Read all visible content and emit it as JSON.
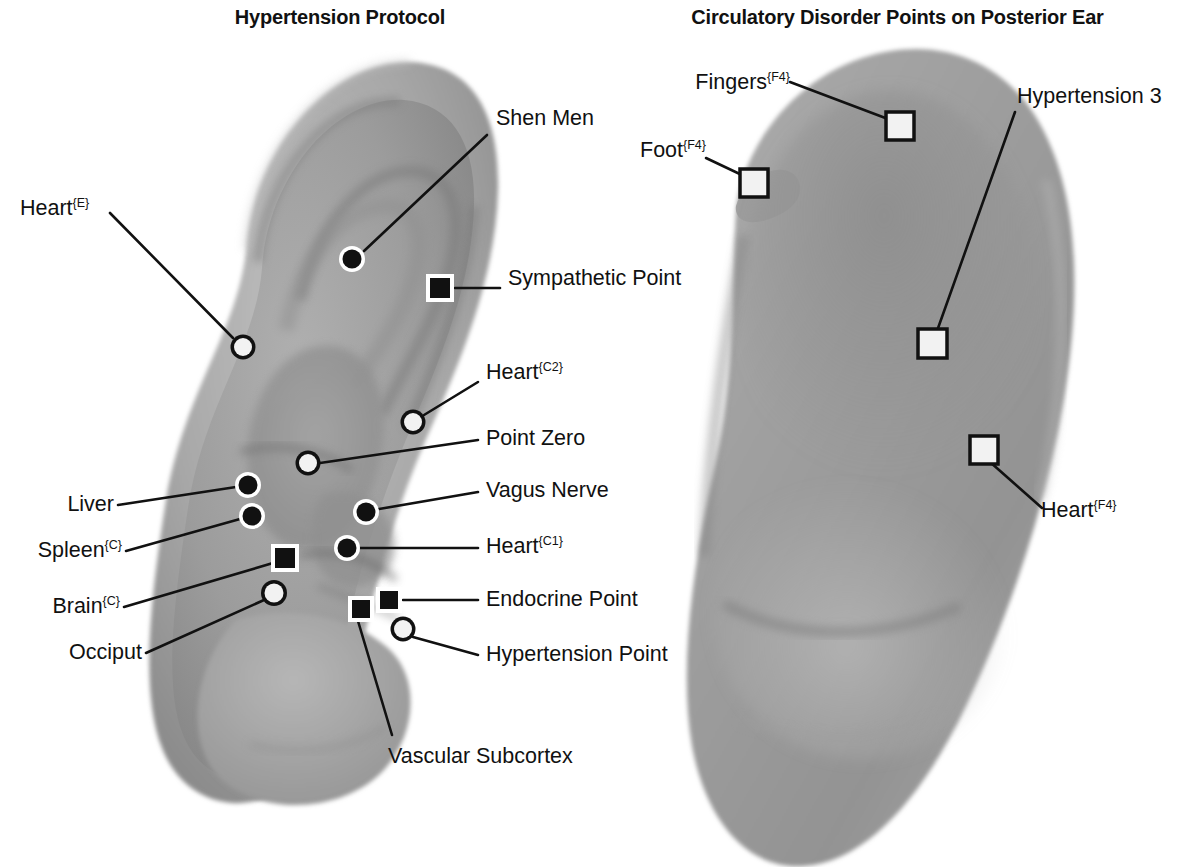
{
  "panels": {
    "left": {
      "title": "Hypertension Protocol",
      "ear_view": "anterior-ear-lateral-surface"
    },
    "right": {
      "title": "Circulatory Disorder Points on Posterior Ear",
      "ear_view": "posterior-ear-surface"
    }
  },
  "labels": {
    "shen_men": "Shen Men",
    "heart_e": "Heart",
    "heart_e_sup": "{E}",
    "sympathetic_point": "Sympathetic Point",
    "heart_c2": "Heart",
    "heart_c2_sup": "{C2}",
    "point_zero": "Point Zero",
    "vagus_nerve": "Vagus Nerve",
    "heart_c1": "Heart",
    "heart_c1_sup": "{C1}",
    "endocrine_point": "Endocrine Point",
    "hypertension_point": "Hypertension Point",
    "liver": "Liver",
    "spleen": "Spleen",
    "spleen_sup": "{C}",
    "brain": "Brain",
    "brain_sup": "{C}",
    "occiput": "Occiput",
    "vascular_subcortex": "Vascular Subcortex",
    "fingers": "Fingers",
    "fingers_sup": "{F4}",
    "foot": "Foot",
    "foot_sup": "{F4}",
    "hypertension_3": "Hypertension 3",
    "heart_f4": "Heart",
    "heart_f4_sup": "{F4}"
  },
  "colors": {
    "background": "#ffffff",
    "text": "#111111",
    "leader_line": "#111111",
    "marker_filled": "#111111",
    "marker_hollow_fill": "#f2f2f2",
    "marker_ring": "#ffffff",
    "ear_light": "#b4b4b4",
    "ear_mid": "#9a9a9a",
    "ear_dark": "#808080",
    "ear_shadow": "#6d6d6d"
  },
  "markers": {
    "left_panel": [
      {
        "id": "shen-men",
        "label": "Shen Men",
        "shape": "circle",
        "style": "filled-ring",
        "x": 352,
        "y": 259
      },
      {
        "id": "heart-e",
        "label": "Heart {E}",
        "shape": "circle",
        "style": "hollow",
        "x": 243,
        "y": 347
      },
      {
        "id": "sympathetic-point",
        "label": "Sympathetic Point",
        "shape": "square",
        "style": "filled-ring",
        "x": 440,
        "y": 288
      },
      {
        "id": "heart-c2",
        "label": "Heart {C2}",
        "shape": "circle",
        "style": "hollow",
        "x": 413,
        "y": 422
      },
      {
        "id": "point-zero",
        "label": "Point Zero",
        "shape": "circle",
        "style": "hollow",
        "x": 308,
        "y": 463
      },
      {
        "id": "liver",
        "label": "Liver",
        "shape": "circle",
        "style": "filled-ring",
        "x": 248,
        "y": 485
      },
      {
        "id": "spleen-c",
        "label": "Spleen {C}",
        "shape": "circle",
        "style": "filled-ring",
        "x": 252,
        "y": 516
      },
      {
        "id": "vagus-nerve",
        "label": "Vagus Nerve",
        "shape": "circle",
        "style": "filled-ring",
        "x": 366,
        "y": 512
      },
      {
        "id": "heart-c1",
        "label": "Heart {C1}",
        "shape": "circle",
        "style": "filled-ring",
        "x": 347,
        "y": 548
      },
      {
        "id": "brain-c",
        "label": "Brain {C}",
        "shape": "square",
        "style": "filled-ring",
        "x": 285,
        "y": 558
      },
      {
        "id": "occiput",
        "label": "Occiput",
        "shape": "circle",
        "style": "hollow",
        "x": 274,
        "y": 593
      },
      {
        "id": "endocrine-point",
        "label": "Endocrine Point",
        "shape": "square",
        "style": "filled-ring",
        "x": 389,
        "y": 600
      },
      {
        "id": "vascular-subcortex",
        "label": "Vascular Subcortex",
        "shape": "square",
        "style": "filled-ring",
        "x": 361,
        "y": 609
      },
      {
        "id": "hypertension-point",
        "label": "Hypertension Point",
        "shape": "circle",
        "style": "hollow",
        "x": 403,
        "y": 629
      }
    ],
    "right_panel": [
      {
        "id": "fingers-f4",
        "label": "Fingers {F4}",
        "shape": "square",
        "style": "hollow",
        "x": 900,
        "y": 126
      },
      {
        "id": "foot-f4",
        "label": "Foot {F4}",
        "shape": "square",
        "style": "hollow",
        "x": 754,
        "y": 183
      },
      {
        "id": "hypertension-3",
        "label": "Hypertension 3",
        "shape": "square",
        "style": "hollow",
        "x": 932,
        "y": 343
      },
      {
        "id": "heart-f4",
        "label": "Heart {F4}",
        "shape": "square",
        "style": "hollow",
        "x": 984,
        "y": 450
      }
    ]
  }
}
